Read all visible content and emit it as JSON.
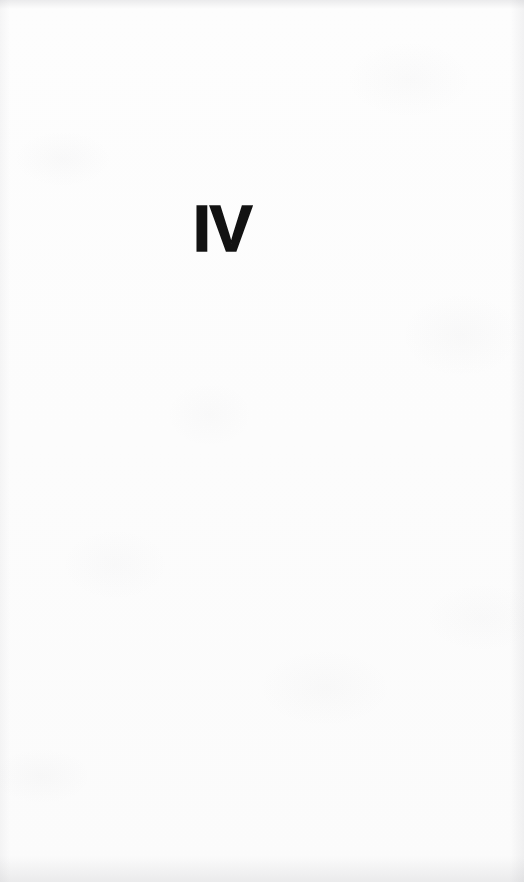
{
  "page": {
    "kind": "book-part-title-page",
    "background_color": "#fcfcfc",
    "ink_color": "#121212",
    "width": 524,
    "height": 882
  },
  "content": {
    "part_number": "IV"
  }
}
